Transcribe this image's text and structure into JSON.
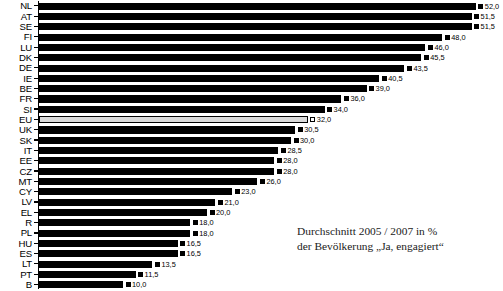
{
  "chart_data": {
    "type": "bar",
    "orientation": "horizontal",
    "title": "",
    "xlabel": "",
    "ylabel": "",
    "xlim": [
      0,
      52
    ],
    "grid": false,
    "legend": "none",
    "value_suffix": "",
    "decimal_separator": ",",
    "categories": [
      "NL",
      "AT",
      "SE",
      "FI",
      "LU",
      "DK",
      "DE",
      "IE",
      "BE",
      "FR",
      "SI",
      "EU",
      "UK",
      "SK",
      "IT",
      "EE",
      "CZ",
      "MT",
      "CY",
      "LV",
      "EL",
      "R",
      "PL",
      "HU",
      "ES",
      "LT",
      "PT",
      "B"
    ],
    "values": [
      52.0,
      51.5,
      51.5,
      48.0,
      46.0,
      45.5,
      43.5,
      40.5,
      39.0,
      36.0,
      34.0,
      32.0,
      30.5,
      30.0,
      28.5,
      28.0,
      28.0,
      26.0,
      23.0,
      21.0,
      20.0,
      18.0,
      18.0,
      16.5,
      16.5,
      13.5,
      11.5,
      10.0
    ],
    "value_labels": [
      "52,0",
      "51,5",
      "51,5",
      "48,0",
      "46,0",
      "45,5",
      "43,5",
      "40,5",
      "39,0",
      "36,0",
      "34,0",
      "32,0",
      "30,5",
      "30,0",
      "28,5",
      "28,0",
      "28,0",
      "26,0",
      "23,0",
      "21,0",
      "20,0",
      "18,0",
      "18,0",
      "16,5",
      "16,5",
      "13,5",
      "11,5",
      "10,0"
    ],
    "highlight_category": "EU",
    "colors": {
      "bar": "#000000",
      "highlight_bar": "#d9d9d9",
      "highlight_border": "#000000",
      "text": "#000000",
      "background": "#ffffff"
    }
  },
  "annotation": {
    "line1": "Durchschnitt 2005 / 2007 in %",
    "line2": "der Bevölkerung „Ja, engagiert“"
  }
}
